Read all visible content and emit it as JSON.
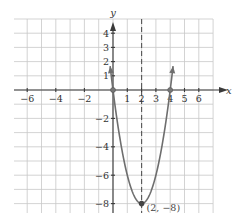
{
  "chart_data": {
    "type": "line",
    "title": "",
    "xlabel": "x",
    "ylabel": "y",
    "xlim": [
      -7,
      7
    ],
    "ylim": [
      -8.8,
      5
    ],
    "grid": true,
    "x_ticks": [
      -6,
      -4,
      -2,
      1,
      2,
      3,
      4,
      5,
      6
    ],
    "x_tick_labels": [
      "−6",
      "−4",
      "−2",
      "1",
      "2",
      "3",
      "4",
      "5",
      "6"
    ],
    "y_ticks": [
      4,
      3,
      2,
      1,
      -2,
      -4,
      -6,
      -8
    ],
    "y_tick_labels": [
      "4",
      "3",
      "2",
      "1",
      "−2",
      "−4",
      "−6",
      "−8"
    ],
    "series": [
      {
        "name": "parabola",
        "equation": "y = 2(x − 2)² − 8",
        "x_range": [
          -0.2,
          4.2
        ],
        "vertex": [
          2,
          -8
        ],
        "x_intercepts": [
          [
            0,
            0
          ],
          [
            4,
            0
          ]
        ],
        "arrows_at_ends": true,
        "color": "#6e6e6e"
      }
    ],
    "axis_of_symmetry": {
      "x": 2,
      "style": "dashed"
    },
    "annotations": [
      {
        "text": "(2, −8)",
        "x": 2,
        "y": -8
      }
    ],
    "marked_points": [
      [
        0,
        0
      ],
      [
        4,
        0
      ],
      [
        2,
        -8
      ]
    ]
  }
}
